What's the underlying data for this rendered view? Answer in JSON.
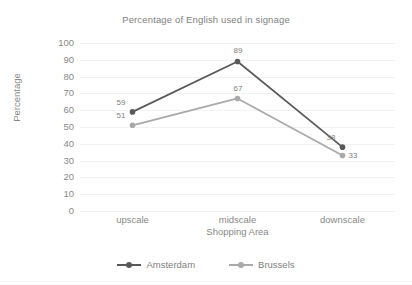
{
  "chart_data": {
    "type": "line",
    "title": "Percentage of English used in signage",
    "xlabel": "Shopping Area",
    "ylabel": "Percentage",
    "categories": [
      "upscale",
      "midscale",
      "downscale"
    ],
    "ylim": [
      0,
      100
    ],
    "ytick_step": 10,
    "yticks": [
      "100",
      "90",
      "80",
      "70",
      "60",
      "50",
      "40",
      "30",
      "20",
      "10",
      "0"
    ],
    "grid": true,
    "legend_position": "bottom",
    "series": [
      {
        "name": "Amsterdam",
        "color": "#595959",
        "values": [
          59,
          89,
          38
        ],
        "labels": [
          "59",
          "89",
          "38"
        ]
      },
      {
        "name": "Brussels",
        "color": "#a9a9a9",
        "values": [
          51,
          67,
          33
        ],
        "labels": [
          "51",
          "67",
          "33"
        ]
      }
    ]
  },
  "colors": {
    "amsterdam": "#595959",
    "brussels": "#a9a9a9",
    "grid": "#f2f2f2",
    "text": "#888888",
    "background": "#ffffff"
  }
}
